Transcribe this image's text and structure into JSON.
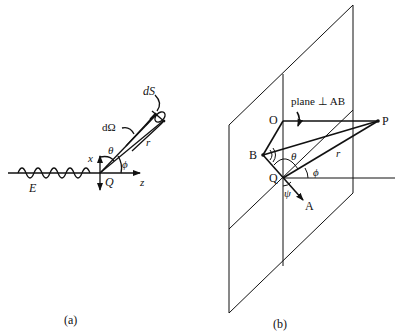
{
  "figure_a": {
    "caption": "(a)",
    "labels": {
      "wave": "E",
      "origin": "Q",
      "x_axis": "x",
      "z_axis": "z",
      "polar_angle": "θ",
      "azimuth_angle": "ϕ",
      "solid_angle": "dΩ",
      "area_element": "dS",
      "distance": "r"
    }
  },
  "figure_b": {
    "caption": "(b)",
    "labels": {
      "plane_note": "plane ⊥ AB",
      "point_O": "O",
      "point_P": "P",
      "point_B": "B",
      "point_Q": "Q",
      "point_A": "A",
      "theta": "θ",
      "phi": "ϕ",
      "psi": "ψ",
      "distance": "r"
    }
  },
  "colors": {
    "ink": "#111111",
    "background": "#ffffff"
  }
}
